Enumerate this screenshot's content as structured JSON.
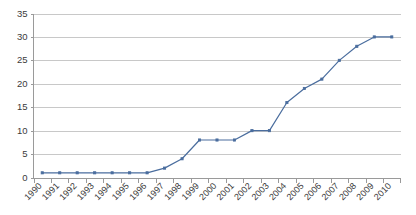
{
  "chart_data": {
    "type": "line",
    "title": "",
    "subtitle": "",
    "xlabel": "",
    "ylabel": "",
    "categories": [
      "1990",
      "1991",
      "1992",
      "1993",
      "1994",
      "1995",
      "1996",
      "1997",
      "1998",
      "1999",
      "2000",
      "2001",
      "2002",
      "2003",
      "2004",
      "2005",
      "2006",
      "2007",
      "2008",
      "2009",
      "2010"
    ],
    "values": [
      1,
      1,
      1,
      1,
      1,
      1,
      1,
      2,
      4,
      8,
      8,
      8,
      10,
      10,
      16,
      19,
      21,
      25,
      28,
      30,
      30
    ],
    "ylim": [
      0,
      35
    ],
    "yticks": [
      0,
      5,
      10,
      15,
      20,
      25,
      30,
      35
    ],
    "ytick_labels": [
      "0",
      "5",
      "10",
      "15",
      "20",
      "25",
      "30",
      "35"
    ],
    "grid": true,
    "grid_axis": "y",
    "legend": false,
    "legend_position": "none",
    "marker": "square",
    "series": [
      {
        "name": "",
        "values": [
          1,
          1,
          1,
          1,
          1,
          1,
          1,
          2,
          4,
          8,
          8,
          8,
          10,
          10,
          16,
          19,
          21,
          25,
          28,
          30,
          30
        ]
      }
    ]
  },
  "style": {
    "series_color": "#4a6d9e",
    "marker_color": "#4a6d9e",
    "grid_color": "#c8c8c8",
    "axis_color": "#9a9a9a",
    "text_color": "#3b3b3b",
    "background": "#ffffff"
  }
}
